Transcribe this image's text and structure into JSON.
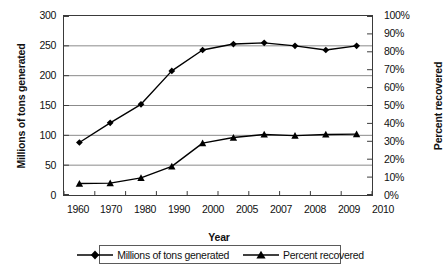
{
  "chart_data": {
    "type": "line",
    "title": "",
    "xlabel": "Year",
    "ylabel": "Millions of tons generated",
    "y2label": "Percent recovered",
    "categories": [
      "1960",
      "1970",
      "1980",
      "1990",
      "2000",
      "2005",
      "2007",
      "2008",
      "2009",
      "2010"
    ],
    "ylim": [
      0,
      300
    ],
    "y2lim": [
      0,
      100
    ],
    "yticks": [
      "0",
      "50",
      "100",
      "150",
      "200",
      "250",
      "300"
    ],
    "y2ticks": [
      "0%",
      "10%",
      "20%",
      "30%",
      "40%",
      "50%",
      "60%",
      "70%",
      "80%",
      "90%",
      "100%"
    ],
    "grid": "horizontal",
    "legend_position": "bottom",
    "series": [
      {
        "name": "Millions of tons generated",
        "axis": "left",
        "marker": "diamond",
        "color": "#000000",
        "values": [
          88,
          121,
          152,
          208,
          243,
          253,
          255,
          250,
          243,
          250
        ]
      },
      {
        "name": "Percent recovered",
        "axis": "right",
        "marker": "triangle",
        "color": "#000000",
        "values": [
          6.4,
          6.6,
          9.6,
          16.0,
          29.0,
          32.1,
          33.8,
          33.2,
          33.8,
          34.0
        ]
      }
    ]
  },
  "legend": {
    "items": [
      {
        "label": "Millions of tons generated",
        "marker": "diamond"
      },
      {
        "label": "Percent recovered",
        "marker": "triangle"
      }
    ]
  }
}
